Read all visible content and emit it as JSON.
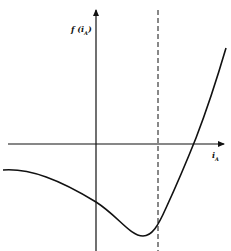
{
  "diagram": {
    "y_axis_label": "f(i_A)",
    "x_axis_label": "i_A",
    "y_label_display": "f (i",
    "y_label_sub": "A",
    "y_label_close": ")",
    "x_label_display": "i",
    "x_label_sub": "A",
    "curve_description": "Curve starts flat on left below x-axis, decreases through y-axis, reaches minimum just left of dashed vertical line, then rises steeply crossing the x-axis to the right of the dashed line.",
    "dashed_line": "vertical asymptote/reference line right of y-axis",
    "colors": {
      "stroke": "#111111",
      "background": "#ffffff"
    }
  }
}
